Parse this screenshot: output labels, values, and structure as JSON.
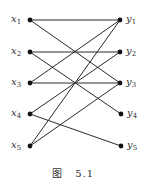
{
  "figure": {
    "caption_prefix": "图",
    "caption_number": "5.1",
    "left_nodes": [
      {
        "id": "x1",
        "base": "x",
        "sub": "1",
        "x": 30,
        "y": 20
      },
      {
        "id": "x2",
        "base": "x",
        "sub": "2",
        "x": 30,
        "y": 52
      },
      {
        "id": "x3",
        "base": "x",
        "sub": "3",
        "x": 30,
        "y": 83
      },
      {
        "id": "x4",
        "base": "x",
        "sub": "4",
        "x": 30,
        "y": 114
      },
      {
        "id": "x5",
        "base": "x",
        "sub": "5",
        "x": 30,
        "y": 146
      }
    ],
    "right_nodes": [
      {
        "id": "y1",
        "base": "y",
        "sub": "1",
        "x": 120,
        "y": 20
      },
      {
        "id": "y2",
        "base": "y",
        "sub": "2",
        "x": 120,
        "y": 52
      },
      {
        "id": "y3",
        "base": "y",
        "sub": "3",
        "x": 120,
        "y": 83
      },
      {
        "id": "y4",
        "base": "y",
        "sub": "4",
        "x": 121,
        "y": 114
      },
      {
        "id": "y5",
        "base": "y",
        "sub": "5",
        "x": 121,
        "y": 146
      }
    ],
    "edges": [
      [
        "x1",
        "y1"
      ],
      [
        "x1",
        "y3"
      ],
      [
        "x2",
        "y2"
      ],
      [
        "x2",
        "y4"
      ],
      [
        "x3",
        "y1"
      ],
      [
        "x3",
        "y3"
      ],
      [
        "x4",
        "y2"
      ],
      [
        "x4",
        "y5"
      ],
      [
        "x5",
        "y1"
      ],
      [
        "x5",
        "y3"
      ]
    ]
  }
}
